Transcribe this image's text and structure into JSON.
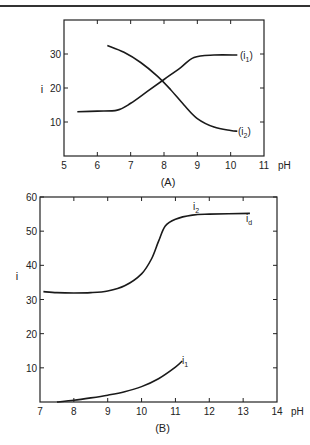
{
  "chart_data": [
    {
      "type": "line",
      "title": "(A)",
      "xlabel": "pH",
      "ylabel": "i",
      "xlim": [
        5,
        11
      ],
      "ylim": [
        0,
        40
      ],
      "x_ticks": [
        "5",
        "6",
        "7",
        "8",
        "9",
        "10",
        "11"
      ],
      "y_ticks": [
        "10",
        "20",
        "30"
      ],
      "grid": false,
      "series": [
        {
          "name": "(i1)",
          "x": [
            5.4,
            6.0,
            6.6,
            7.0,
            7.5,
            8.0,
            8.5,
            8.9,
            9.5,
            10.2
          ],
          "y": [
            13,
            13.2,
            13.5,
            15.5,
            19,
            22.5,
            26,
            29,
            29.7,
            29.7
          ]
        },
        {
          "name": "(i2)",
          "x": [
            6.3,
            6.8,
            7.3,
            7.8,
            8.2,
            8.6,
            9.0,
            9.5,
            10.0,
            10.2
          ],
          "y": [
            32.5,
            30.5,
            27.5,
            23.5,
            19.5,
            15,
            11,
            8.5,
            7.5,
            7.3
          ]
        }
      ]
    },
    {
      "type": "line",
      "title": "(B)",
      "xlabel": "pH",
      "ylabel": "i",
      "xlim": [
        7,
        14
      ],
      "ylim": [
        0,
        60
      ],
      "x_ticks": [
        "7",
        "8",
        "9",
        "10",
        "11",
        "12",
        "13",
        "14"
      ],
      "y_ticks": [
        "10",
        "20",
        "30",
        "40",
        "50",
        "60"
      ],
      "grid": false,
      "annotations": [
        "i2",
        "id",
        "i1"
      ],
      "series": [
        {
          "name": "i2",
          "x": [
            7.1,
            7.5,
            8.0,
            8.5,
            9.0,
            9.5,
            10.0,
            10.3,
            10.5,
            10.7,
            11.0,
            11.5,
            12.0,
            13.2
          ],
          "y": [
            32.3,
            32,
            31.9,
            32,
            32.5,
            34,
            37.5,
            42,
            47,
            51.5,
            53.5,
            54.7,
            55,
            55.2
          ]
        },
        {
          "name": "i1",
          "x": [
            7.5,
            8.0,
            8.5,
            9.0,
            9.5,
            10.0,
            10.5,
            11.0,
            11.2
          ],
          "y": [
            0,
            0.5,
            1.2,
            2,
            3,
            4.5,
            6.8,
            10.2,
            12
          ]
        }
      ]
    }
  ],
  "labels": {
    "a_title": "(A)",
    "b_title": "(B)",
    "a_ylabel": "i",
    "b_ylabel": "i",
    "xunit": "pH",
    "a_i1": "(i",
    "a_i1_sub": "1",
    "a_i2": "(i",
    "a_i2_sub": "2",
    "b_i2": "i",
    "b_i2_sub": "2",
    "b_id": "i",
    "b_id_sub": "d",
    "b_i1": "i",
    "b_i1_sub": "1",
    "close_paren": ")"
  }
}
